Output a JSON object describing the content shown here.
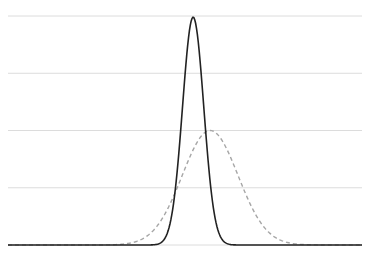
{
  "chart_data": {
    "type": "line",
    "title": "",
    "xlabel": "",
    "ylabel": "",
    "xlim": [
      0,
      100
    ],
    "ylim": [
      0,
      4
    ],
    "grid": {
      "y": true,
      "x": false,
      "y_ticks": [
        0,
        1,
        2,
        3,
        4
      ]
    },
    "legend": null,
    "series": [
      {
        "name": "narrow (solid)",
        "style": "solid",
        "color": "#222222",
        "distribution": {
          "kind": "gaussian",
          "mean": 52.3,
          "sigma": 3.0,
          "peak": 3.98
        },
        "x": [
          0,
          10,
          20,
          30,
          40,
          44,
          46,
          48,
          50,
          52.3,
          54,
          56,
          58,
          60,
          62,
          66,
          70,
          80,
          90,
          100
        ],
        "values": [
          0,
          0,
          0,
          0,
          0.01,
          0.09,
          0.43,
          1.26,
          2.96,
          3.98,
          3.38,
          1.84,
          0.73,
          0.14,
          0.02,
          0,
          0,
          0,
          0,
          0
        ]
      },
      {
        "name": "wide (dashed)",
        "style": "dashed",
        "color": "#a6a6a6",
        "distribution": {
          "kind": "gaussian",
          "mean": 57.1,
          "sigma": 7.9,
          "peak": 2.0
        },
        "x": [
          0,
          10,
          20,
          30,
          40,
          45,
          50,
          57.1,
          62,
          65,
          70,
          75,
          80,
          90,
          100
        ],
        "values": [
          0,
          0,
          0,
          0,
          0.19,
          0.62,
          1.34,
          2.0,
          1.65,
          1.21,
          0.53,
          0.16,
          0.03,
          0,
          0
        ]
      }
    ]
  },
  "plot_area": {
    "left": 8,
    "right": 362,
    "top": 16,
    "bottom": 245
  }
}
